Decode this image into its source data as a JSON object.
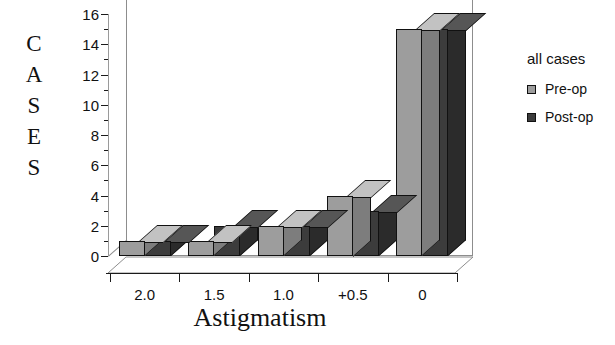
{
  "chart_data": {
    "type": "bar",
    "title": "",
    "xlabel": "Astigmatism",
    "ylabel": "CASES",
    "ylabel_letters": [
      "C",
      "A",
      "S",
      "E",
      "S"
    ],
    "categories": [
      "2.0",
      "1.5",
      "1.0",
      "+0.5",
      "0"
    ],
    "series": [
      {
        "name": "Pre-op",
        "color": "#9d9d9d",
        "values": [
          1,
          1,
          2,
          4,
          15
        ]
      },
      {
        "name": "Post-op",
        "color": "#3c3c3c",
        "values": [
          1,
          2,
          2,
          3,
          15
        ]
      }
    ],
    "ylim": [
      0,
      16
    ],
    "ytick_labels": [
      "0",
      "2",
      "4",
      "6",
      "8",
      "10",
      "12",
      "14",
      "16"
    ],
    "ytick_values": [
      0,
      2,
      4,
      6,
      8,
      10,
      12,
      14,
      16
    ],
    "yminor_values": [
      1,
      3,
      5,
      7,
      9,
      11,
      13,
      15
    ],
    "grid": false,
    "projection": "3d",
    "legend": {
      "position": "right",
      "title": "all cases",
      "entries": [
        {
          "label": "Pre-op",
          "color": "#9d9d9d"
        },
        {
          "label": "Post-op",
          "color": "#3c3c3c"
        }
      ]
    }
  },
  "colors": {
    "axis": "#1a1a1a",
    "frame": "#8d8d8d",
    "background": "#ffffff",
    "preop": "#9d9d9d",
    "postop": "#3c3c3c"
  }
}
